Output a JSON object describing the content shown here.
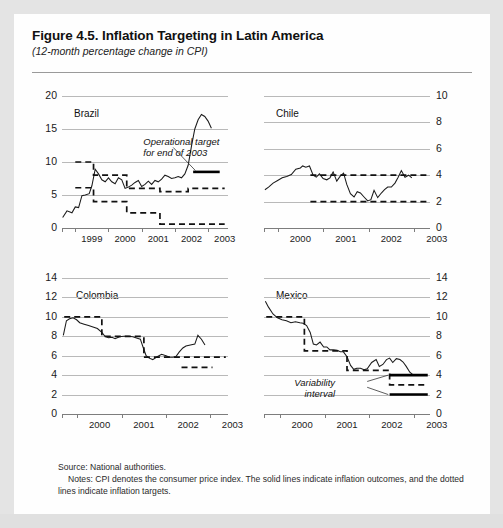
{
  "figure": {
    "title": "Figure 4.5. Inflation Targeting in Latin America",
    "subtitle": "(12-month percentage change in CPI)",
    "source": "Source: National authorities.",
    "notes": "Notes: CPI denotes the consumer price index. The solid lines indicate inflation outcomes, and the dotted lines indicate inflation targets."
  },
  "chart_data": [
    {
      "type": "line",
      "title": "Brazil",
      "xlabel": "",
      "ylabel": "",
      "xlim": [
        1998.6,
        2003.6
      ],
      "ylim": [
        0,
        20
      ],
      "yticks": [
        0,
        5,
        10,
        15,
        20
      ],
      "xticks": [
        1999,
        2000,
        2001,
        2002,
        2003
      ],
      "grid": true,
      "y_axis_side": "left",
      "series": [
        {
          "name": "Inflation outcome (CPI)",
          "style": "solid",
          "x": [
            1998.62,
            1998.75,
            1998.9,
            1999.0,
            1999.1,
            1999.2,
            1999.3,
            1999.42,
            1999.5,
            1999.6,
            1999.7,
            1999.8,
            1999.9,
            2000.0,
            2000.1,
            2000.2,
            2000.3,
            2000.4,
            2000.5,
            2000.6,
            2000.7,
            2000.8,
            2000.9,
            2001.0,
            2001.1,
            2001.2,
            2001.3,
            2001.4,
            2001.5,
            2001.6,
            2001.7,
            2001.8,
            2001.9,
            2002.0,
            2002.1,
            2002.2,
            2002.3,
            2002.4,
            2002.5,
            2002.6,
            2002.7,
            2002.8,
            2002.9,
            2003.0,
            2003.1,
            2003.2,
            2003.3,
            2003.45
          ],
          "y": [
            1.6,
            2.6,
            2.3,
            3.2,
            3.1,
            4.9,
            5.0,
            5.2,
            6.4,
            8.9,
            8.2,
            7.3,
            7.0,
            7.6,
            7.0,
            6.7,
            7.6,
            7.3,
            6.0,
            6.2,
            6.5,
            6.9,
            7.2,
            6.3,
            6.6,
            7.1,
            6.6,
            7.2,
            7.0,
            7.4,
            8.0,
            7.8,
            7.5,
            7.6,
            7.8,
            7.6,
            8.2,
            9.5,
            12.4,
            15.0,
            16.4,
            17.2,
            16.9,
            16.2,
            15.1
          ]
        },
        {
          "name": "Inflation target upper band",
          "style": "dashed-steps",
          "steps": [
            {
              "from": 1999.0,
              "to": 1999.55,
              "value": 10.0
            },
            {
              "from": 1999.55,
              "to": 2000.55,
              "value": 8.0
            },
            {
              "from": 2000.55,
              "to": 2001.55,
              "value": 6.0
            },
            {
              "from": 2001.55,
              "to": 2002.4,
              "value": 5.5
            },
            {
              "from": 2002.4,
              "to": 2003.5,
              "value": 6.0
            }
          ]
        },
        {
          "name": "Inflation target center/lower band",
          "style": "dashed-steps",
          "steps": [
            {
              "from": 1999.0,
              "to": 1999.55,
              "value": 6.1
            },
            {
              "from": 1999.55,
              "to": 2000.55,
              "value": 4.0
            },
            {
              "from": 2000.55,
              "to": 2001.55,
              "value": 2.3
            },
            {
              "from": 2001.55,
              "to": 2003.5,
              "value": 0.6
            }
          ]
        },
        {
          "name": "Operational target for end of 2003",
          "style": "solid-bar",
          "from": 2002.55,
          "to": 2003.35,
          "value": 8.5
        }
      ],
      "annotations": [
        {
          "text_lines": [
            "Operational target",
            "for end of 2003"
          ],
          "x": 2001.05,
          "y": 12.9
        }
      ]
    },
    {
      "type": "line",
      "title": "Chile",
      "xlabel": "",
      "ylabel": "",
      "xlim": [
        1999.7,
        2003.35
      ],
      "ylim": [
        0,
        10
      ],
      "yticks": [
        0,
        2,
        4,
        6,
        8,
        10
      ],
      "xticks": [
        2000,
        2001,
        2002,
        2003
      ],
      "grid": true,
      "y_axis_side": "right",
      "series": [
        {
          "name": "Inflation outcome (CPI)",
          "style": "solid",
          "x": [
            1999.72,
            1999.8,
            1999.9,
            2000.0,
            2000.1,
            2000.2,
            2000.3,
            2000.4,
            2000.5,
            2000.55,
            2000.62,
            2000.7,
            2000.78,
            2000.85,
            2000.92,
            2001.0,
            2001.08,
            2001.15,
            2001.22,
            2001.3,
            2001.38,
            2001.45,
            2001.52,
            2001.6,
            2001.68,
            2001.75,
            2001.82,
            2001.9,
            2001.98,
            2002.05,
            2002.12,
            2002.2,
            2002.28,
            2002.35,
            2002.42,
            2002.5,
            2002.58,
            2002.65,
            2002.72,
            2002.8,
            2002.88,
            2002.95
          ],
          "y": [
            2.9,
            3.1,
            3.4,
            3.6,
            3.8,
            3.9,
            4.05,
            4.45,
            4.55,
            4.7,
            4.6,
            4.7,
            4.0,
            3.85,
            4.1,
            3.75,
            3.65,
            3.8,
            4.25,
            3.55,
            3.95,
            4.15,
            3.3,
            2.6,
            2.35,
            2.75,
            2.65,
            2.35,
            2.05,
            2.15,
            2.85,
            2.3,
            2.65,
            2.9,
            3.1,
            3.1,
            3.4,
            3.85,
            4.35,
            3.85,
            4.0,
            3.8
          ]
        },
        {
          "name": "Inflation target upper band",
          "style": "dashed-steps",
          "steps": [
            {
              "from": 2000.72,
              "to": 2003.3,
              "value": 4.0
            }
          ]
        },
        {
          "name": "Inflation target lower band",
          "style": "dashed-steps",
          "steps": [
            {
              "from": 2000.72,
              "to": 2003.3,
              "value": 2.0
            }
          ]
        }
      ],
      "annotations": []
    },
    {
      "type": "line",
      "title": "Colombia",
      "xlabel": "",
      "ylabel": "",
      "xlim": [
        1999.65,
        2003.4
      ],
      "ylim": [
        0,
        14
      ],
      "yticks": [
        0,
        2,
        4,
        6,
        8,
        10,
        12,
        14
      ],
      "xticks": [
        2000,
        2001,
        2002,
        2003
      ],
      "grid": true,
      "y_axis_side": "left",
      "series": [
        {
          "name": "Inflation outcome (CPI)",
          "style": "solid",
          "x": [
            1999.68,
            1999.75,
            1999.82,
            1999.9,
            1999.98,
            2000.05,
            2000.15,
            2000.25,
            2000.35,
            2000.45,
            2000.55,
            2000.62,
            2000.7,
            2000.78,
            2000.85,
            2000.95,
            2001.05,
            2001.15,
            2001.25,
            2001.35,
            2001.42,
            2001.48,
            2001.55,
            2001.62,
            2001.7,
            2001.8,
            2001.9,
            2002.0,
            2002.08,
            2002.15,
            2002.22,
            2002.3,
            2002.38,
            2002.45,
            2002.55,
            2002.65,
            2002.72,
            2002.8,
            2002.88
          ],
          "y": [
            8.1,
            9.6,
            9.8,
            9.9,
            9.7,
            9.4,
            9.25,
            9.1,
            8.95,
            8.8,
            8.4,
            8.0,
            7.85,
            7.9,
            7.75,
            7.95,
            8.0,
            8.0,
            7.95,
            7.8,
            7.7,
            6.9,
            6.0,
            5.75,
            5.6,
            5.9,
            6.15,
            6.0,
            5.85,
            5.85,
            5.9,
            6.4,
            6.8,
            7.0,
            7.1,
            7.2,
            8.1,
            7.7,
            7.1
          ]
        },
        {
          "name": "Inflation target upper band",
          "style": "dashed-steps",
          "steps": [
            {
              "from": 1999.7,
              "to": 2000.55,
              "value": 10.0
            },
            {
              "from": 2000.55,
              "to": 2001.5,
              "value": 8.0
            },
            {
              "from": 2001.5,
              "to": 2003.35,
              "value": 5.85
            }
          ]
        },
        {
          "name": "Inflation target lower band",
          "style": "dashed-steps",
          "steps": [
            {
              "from": 2002.35,
              "to": 2003.05,
              "value": 4.8
            }
          ]
        }
      ],
      "annotations": []
    },
    {
      "type": "line",
      "title": "Mexico",
      "xlabel": "",
      "ylabel": "",
      "xlim": [
        1999.65,
        2003.35
      ],
      "ylim": [
        0,
        14
      ],
      "yticks": [
        0,
        2,
        4,
        6,
        8,
        10,
        12,
        14
      ],
      "xticks": [
        2000,
        2001,
        2002,
        2003
      ],
      "grid": true,
      "y_axis_side": "right",
      "series": [
        {
          "name": "Inflation outcome (CPI)",
          "style": "solid",
          "x": [
            1999.68,
            1999.75,
            1999.85,
            1999.95,
            2000.05,
            2000.15,
            2000.25,
            2000.35,
            2000.45,
            2000.52,
            2000.6,
            2000.68,
            2000.75,
            2000.82,
            2000.9,
            2000.98,
            2001.05,
            2001.12,
            2001.2,
            2001.28,
            2001.35,
            2001.42,
            2001.5,
            2001.58,
            2001.65,
            2001.72,
            2001.8,
            2001.88,
            2001.95,
            2002.05,
            2002.15,
            2002.22,
            2002.3,
            2002.38,
            2002.45,
            2002.52,
            2002.6,
            2002.68,
            2002.75,
            2002.82,
            2002.9,
            2002.98
          ],
          "y": [
            11.6,
            11.0,
            10.3,
            9.9,
            9.7,
            9.6,
            9.4,
            9.5,
            9.4,
            9.35,
            9.1,
            8.4,
            7.2,
            7.1,
            7.4,
            6.9,
            6.9,
            6.6,
            6.6,
            6.55,
            6.4,
            6.4,
            5.9,
            5.0,
            4.6,
            4.7,
            4.7,
            4.55,
            4.65,
            5.3,
            5.6,
            4.9,
            5.1,
            5.6,
            5.75,
            5.3,
            5.7,
            5.6,
            5.35,
            4.9,
            4.3,
            4.0
          ]
        },
        {
          "name": "Inflation target steps",
          "style": "dashed-steps",
          "steps": [
            {
              "from": 1999.7,
              "to": 2000.55,
              "value": 10.0
            },
            {
              "from": 2000.55,
              "to": 2001.5,
              "value": 6.5
            },
            {
              "from": 2001.5,
              "to": 2002.45,
              "value": 4.5
            },
            {
              "from": 2002.45,
              "to": 2003.3,
              "value": 3.0
            }
          ]
        },
        {
          "name": "Variability interval upper",
          "style": "solid-bar",
          "from": 2002.45,
          "to": 2003.3,
          "value": 4.0
        },
        {
          "name": "Variability interval lower",
          "style": "solid-bar",
          "from": 2002.45,
          "to": 2003.3,
          "value": 2.0
        }
      ],
      "annotations": [
        {
          "text_lines": [
            "Variability",
            "interval"
          ],
          "x": 2001.35,
          "y": 3.1
        }
      ]
    }
  ]
}
